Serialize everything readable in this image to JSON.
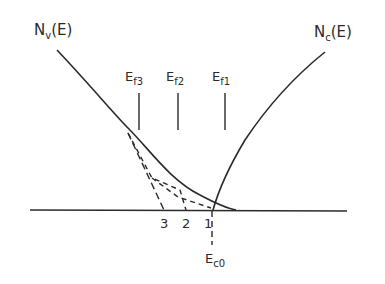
{
  "diagram": {
    "title": "",
    "curves": {
      "valence": {
        "label_main": "N",
        "label_sub": "v",
        "label_tail": "(E)"
      },
      "conduction": {
        "label_main": "N",
        "label_sub": "c",
        "label_tail": "(E)"
      }
    },
    "fermi_levels": [
      {
        "main": "E",
        "sub": "f3"
      },
      {
        "main": "E",
        "sub": "f2"
      },
      {
        "main": "E",
        "sub": "f1"
      }
    ],
    "intercepts": [
      "3",
      "2",
      "1"
    ],
    "band_edge": {
      "main": "E",
      "sub": "c0"
    },
    "colors": {
      "ink": "#2a2a2a",
      "background": "#ffffff"
    }
  }
}
